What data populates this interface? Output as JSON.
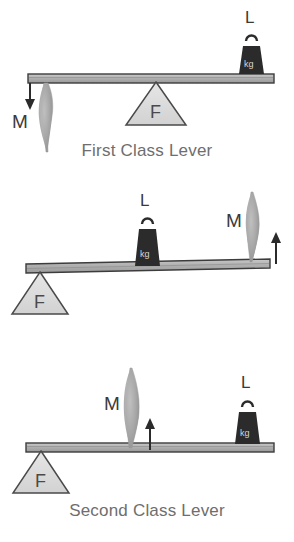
{
  "figure": {
    "colors": {
      "beam_fill": "#b4b4b4",
      "beam_stroke": "#3c3c3c",
      "fulcrum_fill": "#dcdcdc",
      "fulcrum_stroke": "#4a4a4a",
      "muscle_fill": "#a8a8a8",
      "weight_fill": "#2b2b2b",
      "arrow_color": "#2b2b2b",
      "caption_color": "#6e6e6e",
      "label_color": "#3a3a3a",
      "background": "#ffffff"
    }
  },
  "panels": [
    {
      "id": "first-class-lever",
      "caption": "First Class Lever",
      "order": "M - F - L",
      "muscle": {
        "label": "M",
        "name": "muscle",
        "position": "left-end",
        "attachment": "below-beam",
        "arrow_direction": "down"
      },
      "fulcrum": {
        "label": "F",
        "name": "fulcrum",
        "position": "center",
        "side": "below-beam"
      },
      "load": {
        "label": "L",
        "name": "load-weight",
        "weight_text": "kg",
        "position": "right-end",
        "side": "above-beam"
      }
    },
    {
      "id": "second-class-lever",
      "caption": "Second Class Lever",
      "order": "F - L - M",
      "muscle": {
        "label": "M",
        "name": "muscle",
        "position": "right-end",
        "attachment": "above-beam",
        "arrow_direction": "up"
      },
      "fulcrum": {
        "label": "F",
        "name": "fulcrum",
        "position": "left-end",
        "side": "below-beam"
      },
      "load": {
        "label": "L",
        "name": "load-weight",
        "weight_text": "kg",
        "position": "center",
        "side": "above-beam"
      }
    },
    {
      "id": "third-class-lever",
      "caption": "Third Class Lever",
      "order": "F - M - L",
      "muscle": {
        "label": "M",
        "name": "muscle",
        "position": "center",
        "attachment": "above-beam",
        "arrow_direction": "up"
      },
      "fulcrum": {
        "label": "F",
        "name": "fulcrum",
        "position": "left-end",
        "side": "below-beam"
      },
      "load": {
        "label": "L",
        "name": "load-weight",
        "weight_text": "kg",
        "position": "right",
        "side": "above-beam"
      }
    }
  ]
}
